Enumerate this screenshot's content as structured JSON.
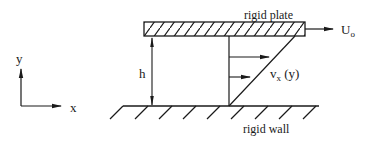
{
  "diagram": {
    "type": "couette-flow-schematic",
    "labels": {
      "top_plate": "rigid plate",
      "bottom_wall": "rigid wall",
      "plate_velocity": "U",
      "plate_velocity_sub": "o",
      "gap_height": "h",
      "velocity_profile": "v",
      "velocity_profile_sub": "x",
      "velocity_profile_arg": " (y)",
      "axis_x": "x",
      "axis_y": "y"
    },
    "colors": {
      "stroke": "#1a1a1a",
      "background": "#ffffff"
    },
    "elements": [
      {
        "name": "rigid-plate",
        "shape": "hatched-rectangle"
      },
      {
        "name": "rigid-wall",
        "shape": "hatched-ground-line",
        "hatch_count": 9
      },
      {
        "name": "plate-velocity-arrow",
        "direction": "+x"
      },
      {
        "name": "height-dimension-arrow",
        "direction": "double-headed vertical"
      },
      {
        "name": "velocity-profile",
        "shape": "linear triangle",
        "arrow_count": 2
      },
      {
        "name": "coordinate-axes",
        "axes": [
          "x",
          "y"
        ]
      }
    ]
  }
}
